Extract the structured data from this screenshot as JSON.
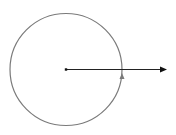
{
  "diagram": {
    "canvas": {
      "width": 176,
      "height": 135,
      "background": "#ffffff"
    },
    "circle": {
      "cx": 66,
      "cy": 69.5,
      "r": 56,
      "stroke": "#7a7a7a",
      "stroke_width": 1.2,
      "orientation": "counterclockwise"
    },
    "center_point": {
      "x": 66,
      "y": 69.5,
      "size": 2.4,
      "color": "#111111"
    },
    "vector_arrow": {
      "x1": 66,
      "y1": 69.5,
      "x2": 167,
      "y2": 69.5,
      "stroke": "#222222",
      "stroke_width": 1.1,
      "head_color": "#111111"
    },
    "orientation_marker": {
      "x": 122,
      "y": 77,
      "direction": "up",
      "color": "#7a7a7a"
    }
  }
}
